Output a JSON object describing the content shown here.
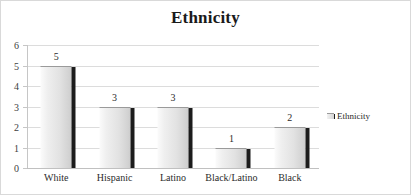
{
  "chart_data": {
    "type": "bar",
    "title": "Ethnicity",
    "categories": [
      "White",
      "Hispanic",
      "Latino",
      "Black/Latino",
      "Black"
    ],
    "values": [
      5,
      3,
      3,
      1,
      2
    ],
    "series": [
      {
        "name": "Ethnicity",
        "values": [
          5,
          3,
          3,
          1,
          2
        ]
      }
    ],
    "data_labels": [
      "5",
      "3",
      "3",
      "1",
      "2"
    ],
    "xlabel": "",
    "ylabel": "",
    "ylim": [
      0,
      6
    ],
    "y_ticks": [
      "0",
      "1",
      "2",
      "3",
      "4",
      "5",
      "6"
    ],
    "grid": true,
    "legend": {
      "position": "right",
      "entries": [
        "Ethnicity"
      ]
    },
    "colors": {
      "bar_light": "#fbfbfb",
      "bar_dark": "#cccccc",
      "bar_shadow": "#1c1c1c",
      "gridline": "#dcdcdc",
      "axis": "#c6c6c6",
      "text": "#2b2b2b",
      "title": "#1a1a1a",
      "frame": "#d9d9d9",
      "background": "#ffffff"
    }
  }
}
